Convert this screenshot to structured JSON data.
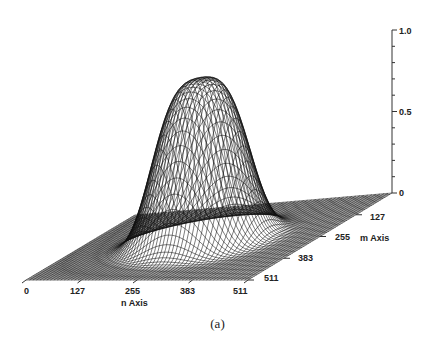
{
  "caption": "(a)",
  "chart_data": {
    "type": "surface3d",
    "title": "",
    "x_axis": {
      "label": "n Axis",
      "ticks": [
        "0",
        "127",
        "255",
        "383",
        "511"
      ],
      "range": [
        0,
        511
      ]
    },
    "y_axis": {
      "label": "m Axis",
      "ticks": [
        "127",
        "255",
        "383",
        "511"
      ],
      "range": [
        0,
        511
      ]
    },
    "z_axis": {
      "label": "",
      "ticks": [
        "0",
        "0.5",
        "1.0"
      ],
      "range": [
        0,
        1.0
      ],
      "minor_ticks": 10
    },
    "peak": {
      "n_center": 255,
      "m_center": 255,
      "value": 1.0,
      "flat_top": true
    },
    "grid": false,
    "legend": null,
    "mesh_color": "#111111"
  },
  "labels": {
    "n_axis": "n Axis",
    "m_axis": "m Axis",
    "n_ticks": [
      "0",
      "127",
      "255",
      "383",
      "511"
    ],
    "m_ticks": [
      "127",
      "255",
      "383",
      "511"
    ],
    "z_ticks": [
      "1.0",
      "0.5",
      "0"
    ]
  }
}
